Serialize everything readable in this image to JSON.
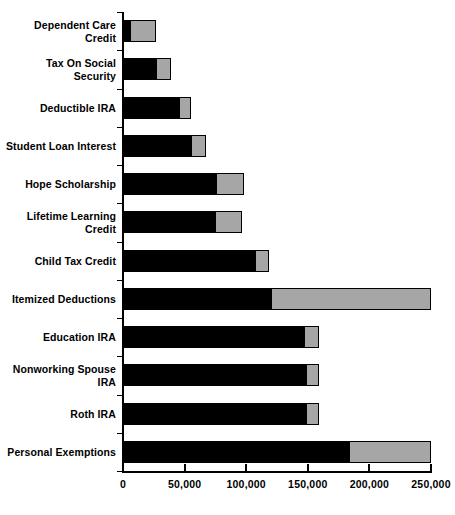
{
  "chart_data": {
    "type": "bar",
    "orientation": "horizontal",
    "stacked": true,
    "title": "",
    "subtitle": "",
    "xlabel": "",
    "ylabel": "",
    "xlim": [
      0,
      250000
    ],
    "ylim": null,
    "grid": false,
    "legend": null,
    "legend_position": "none",
    "xticks": [
      0,
      50000,
      100000,
      150000,
      200000,
      250000
    ],
    "xtick_labels": [
      "0",
      "50,000",
      "100,000",
      "150,000",
      "200,000",
      "250,000"
    ],
    "categories": [
      "Dependent Care Credit",
      "Tax On Social Security",
      "Deductible IRA",
      "Student Loan Interest",
      "Hope Scholarship",
      "Lifetime Learning Credit",
      "Child Tax Credit",
      "Itemized Deductions",
      "Education IRA",
      "Nonworking Spouse IRA",
      "Roth IRA",
      "Personal Exemptions"
    ],
    "series": [
      {
        "name": "Lower bound",
        "color": "#000000",
        "values": [
          6500,
          27500,
          46000,
          56000,
          76000,
          75500,
          108000,
          121000,
          148000,
          149000,
          149000,
          184000
        ]
      },
      {
        "name": "Upper extension",
        "color": "#a6a6a6",
        "values": [
          19500,
          10500,
          8500,
          10500,
          21000,
          20500,
          10000,
          128000,
          10000,
          9000,
          9000,
          65000
        ]
      }
    ],
    "totals": [
      26000,
      38000,
      54500,
      66500,
      97000,
      96000,
      118000,
      249000,
      158000,
      158000,
      158000,
      249000
    ]
  },
  "axis": {
    "value_axis_name": "value-axis",
    "category_axis_name": "category-axis"
  }
}
